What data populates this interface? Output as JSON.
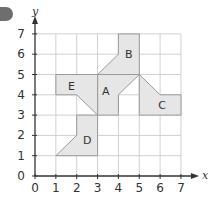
{
  "question_badge": {
    "label": ""
  },
  "chart_data": {
    "type": "coordinate-grid",
    "xlabel": "x",
    "ylabel": "y",
    "x_ticks": [
      "0",
      "1",
      "2",
      "3",
      "4",
      "5",
      "6",
      "7"
    ],
    "y_ticks": [
      "0",
      "1",
      "2",
      "3",
      "4",
      "5",
      "6",
      "7"
    ],
    "xlim": [
      0,
      7
    ],
    "ylim": [
      0,
      7
    ],
    "grid": true,
    "shapes": [
      {
        "name": "A",
        "vertices": [
          [
            3,
            5
          ],
          [
            5,
            5
          ],
          [
            4,
            4
          ],
          [
            4,
            3
          ],
          [
            3,
            3
          ]
        ],
        "label_at": [
          3.4,
          4.2
        ]
      },
      {
        "name": "B",
        "vertices": [
          [
            4,
            7
          ],
          [
            5,
            7
          ],
          [
            5,
            5
          ],
          [
            3,
            5
          ],
          [
            4,
            6
          ]
        ],
        "label_at": [
          4.5,
          6.0
        ]
      },
      {
        "name": "C",
        "vertices": [
          [
            5,
            5
          ],
          [
            6,
            4
          ],
          [
            7,
            4
          ],
          [
            7,
            3
          ],
          [
            5,
            3
          ]
        ],
        "label_at": [
          6.1,
          3.5
        ]
      },
      {
        "name": "D",
        "vertices": [
          [
            2,
            3
          ],
          [
            3,
            3
          ],
          [
            3,
            1
          ],
          [
            1,
            1
          ],
          [
            2,
            2
          ]
        ],
        "label_at": [
          2.5,
          1.75
        ]
      },
      {
        "name": "E",
        "vertices": [
          [
            1,
            5
          ],
          [
            3,
            5
          ],
          [
            3,
            3
          ],
          [
            2,
            4
          ],
          [
            1,
            4
          ]
        ],
        "label_at": [
          1.75,
          4.45
        ]
      }
    ]
  },
  "colors": {
    "fill": "#e6e6e6",
    "outline": "#9a9a9a",
    "grid": "#d0d0d0",
    "axis": "#333333",
    "badge": "#6e6e6e"
  }
}
